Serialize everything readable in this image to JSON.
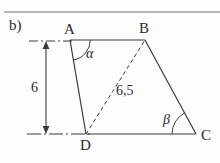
{
  "figure": {
    "part_label": "b)",
    "shape": "quadrilateral",
    "vertices": [
      {
        "name": "A",
        "label": "A",
        "x": 70,
        "y": 40,
        "label_x": 64,
        "label_y": 22
      },
      {
        "name": "B",
        "label": "B",
        "x": 145,
        "y": 40,
        "label_x": 139,
        "label_y": 21
      },
      {
        "name": "C",
        "label": "C",
        "x": 196,
        "y": 134,
        "label_x": 201,
        "label_y": 128
      },
      {
        "name": "D",
        "label": "D",
        "x": 86,
        "y": 134,
        "label_x": 80,
        "label_y": 138
      }
    ],
    "edges": [
      {
        "name": "edge-AB",
        "from": "A",
        "to": "B",
        "style": "solid"
      },
      {
        "name": "edge-BC",
        "from": "B",
        "to": "C",
        "style": "solid"
      },
      {
        "name": "edge-CD",
        "from": "C",
        "to": "D",
        "style": "solid"
      },
      {
        "name": "edge-DA",
        "from": "D",
        "to": "A",
        "style": "solid"
      }
    ],
    "diagonal": {
      "name": "diagonal-DB",
      "from": "D",
      "to": "B",
      "style": "dashed",
      "length_label": "6,5",
      "label_x": 116,
      "label_y": 84
    },
    "angles": [
      {
        "name": "alpha",
        "label": "α",
        "at_vertex": "A",
        "label_x": 86,
        "label_y": 47
      },
      {
        "name": "beta",
        "label": "β",
        "at_vertex": "C",
        "label_x": 163,
        "label_y": 113
      }
    ],
    "dimension": {
      "name": "height-dimension",
      "label": "6",
      "label_x": 31,
      "label_y": 81,
      "arrow_x": 46,
      "top_y": 43,
      "bottom_y": 132,
      "extension_top": {
        "x1": 29,
        "x2": 74,
        "y": 41
      },
      "extension_bottom": {
        "x1": 27,
        "x2": 90,
        "y": 134
      }
    },
    "top_rule": {
      "name": "top-divider",
      "x1": 4,
      "x2": 220,
      "y": 12
    },
    "colors": {
      "stroke": "#3b3b3b",
      "text": "#2a2a2a",
      "background": "#fdfdfd",
      "rule": "#6e6e6e"
    }
  }
}
